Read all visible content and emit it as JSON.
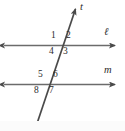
{
  "figure": {
    "kind": "geometry-diagram",
    "width": 125,
    "height": 131,
    "background_color": "#ffffff",
    "stroke_color": "#5a5a5a",
    "text_color": "#2b2b2b"
  },
  "lines": [
    {
      "id": "line-l",
      "label": "ℓ",
      "orientation": "horizontal",
      "y": 45.5,
      "x_start": 3,
      "x_end": 116,
      "arrow_start": true,
      "arrow_end": true,
      "label_x": 104,
      "label_y": 30
    },
    {
      "id": "line-m",
      "label": "m",
      "orientation": "horizontal",
      "y": 84.5,
      "x_start": 3,
      "x_end": 116,
      "arrow_start": true,
      "arrow_end": true,
      "label_x": 105,
      "label_y": 68
    },
    {
      "id": "line-t",
      "label": "t",
      "orientation": "transversal",
      "x_start": 36,
      "y_start": 126,
      "x_end": 76,
      "y_end": 8,
      "arrow_start": true,
      "arrow_end": true,
      "label_x": 80,
      "label_y": 5
    }
  ],
  "intersections": [
    {
      "id": "intersection-upper",
      "line": "ℓ",
      "x": 61,
      "y": 45.5
    },
    {
      "id": "intersection-lower",
      "line": "m",
      "x": 48,
      "y": 84.5
    }
  ],
  "angle_labels": [
    {
      "id": "angle-1",
      "text": "1",
      "position": "upper-left",
      "x": 51,
      "y": 33
    },
    {
      "id": "angle-2",
      "text": "2",
      "position": "upper-right",
      "x": 66,
      "y": 33
    },
    {
      "id": "angle-4",
      "text": "4",
      "position": "lower-left",
      "x": 49,
      "y": 48
    },
    {
      "id": "angle-3",
      "text": "3",
      "position": "lower-right",
      "x": 63,
      "y": 48
    },
    {
      "id": "angle-5",
      "text": "5",
      "position": "upper-left",
      "x": 39,
      "y": 71
    },
    {
      "id": "angle-6",
      "text": "6",
      "position": "upper-right",
      "x": 54,
      "y": 71
    },
    {
      "id": "angle-8",
      "text": "8",
      "position": "lower-left",
      "x": 35,
      "y": 87
    },
    {
      "id": "angle-7",
      "text": "7",
      "position": "lower-right",
      "x": 50,
      "y": 87
    }
  ],
  "footer": {
    "y": 121,
    "height": 10,
    "color": "#fbfbfb"
  }
}
